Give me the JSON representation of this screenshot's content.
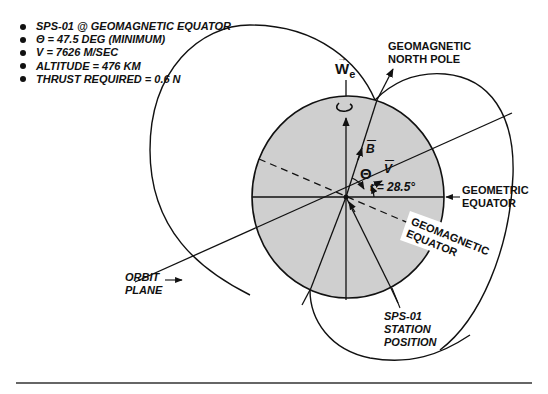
{
  "figure": {
    "bullets": [
      "SPS-01 @ GEOMAGNETIC EQUATOR",
      "Θ = 47.5 DEG (MINIMUM)",
      "V = 7626 M/SEC",
      "ALTITUDE = 476 KM",
      "THRUST REQUIRED = 0.6 N"
    ],
    "labels": {
      "geomagnetic_north_pole_line1": "GEOMAGNETIC",
      "geomagnetic_north_pole_line2": "NORTH POLE",
      "geometric_equator_line1": "GEOMETRIC",
      "geometric_equator_line2": "EQUATOR",
      "geomagnetic_equator_line1": "GEOMAGNETIC",
      "geomagnetic_equator_line2": "EQUATOR",
      "orbit_plane_line1": "ORBIT",
      "orbit_plane_line2": "PLANE",
      "station_line1": "SPS-01",
      "station_line2": "STATION",
      "station_line3": "POSITION"
    },
    "symbols": {
      "earth_rotation": "W",
      "earth_rotation_sub": "e",
      "magnetic_field": "B",
      "velocity": "V",
      "theta": "Θ",
      "inclination": "ι = 28.5°"
    },
    "colors": {
      "globe_fill": "#cfcfcf",
      "line": "#111111",
      "rule": "#333333"
    }
  }
}
